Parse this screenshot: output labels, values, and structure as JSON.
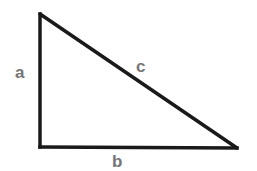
{
  "diagram": {
    "type": "right-triangle",
    "stroke_color": "#1a1a1a",
    "label_color": "#767676",
    "vertices": {
      "top": [
        40,
        14
      ],
      "right_angle": [
        40,
        147
      ],
      "bottom_right": [
        237,
        148
      ]
    },
    "labels": {
      "a": "a",
      "b": "b",
      "c": "c"
    },
    "sides": [
      {
        "name": "a",
        "description": "vertical leg"
      },
      {
        "name": "b",
        "description": "horizontal leg"
      },
      {
        "name": "c",
        "description": "hypotenuse"
      }
    ]
  }
}
